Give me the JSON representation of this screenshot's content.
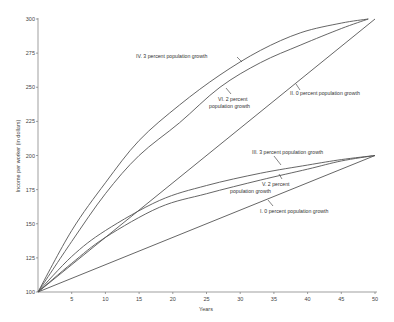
{
  "chart_data": {
    "type": "line",
    "title": "",
    "xlabel": "Years",
    "ylabel": "Income per worker (in dollars)",
    "xlim": [
      0,
      50
    ],
    "ylim": [
      100,
      300
    ],
    "xticks": [
      5,
      10,
      15,
      20,
      25,
      30,
      35,
      40,
      45,
      50
    ],
    "yticks": [
      100,
      125,
      150,
      175,
      200,
      225,
      250,
      275,
      300
    ],
    "grid": false,
    "legend": "inline annotations",
    "series": [
      {
        "name": "I. 0 percent population growth",
        "x": [
          0,
          50
        ],
        "y": [
          100,
          200
        ]
      },
      {
        "name": "II. 0 percent population growth",
        "x": [
          0,
          50
        ],
        "y": [
          100,
          300
        ]
      },
      {
        "name": "III. 3 percent population growth",
        "x": [
          0,
          5,
          10,
          18,
          25,
          33,
          40,
          45,
          50
        ],
        "y": [
          100,
          126,
          145,
          167,
          178,
          187,
          193,
          197,
          200
        ]
      },
      {
        "name": "IV. 3 percent population growth",
        "x": [
          0,
          5,
          10,
          15,
          21,
          27,
          33,
          39,
          45,
          49
        ],
        "y": [
          100,
          145,
          180,
          211,
          237,
          259,
          277,
          290,
          297,
          300
        ]
      },
      {
        "name": "V. 2 percent population growth",
        "x": [
          0,
          5,
          10,
          18,
          25,
          33,
          40,
          45,
          50
        ],
        "y": [
          100,
          121,
          140,
          162,
          172,
          182,
          190,
          196,
          200
        ]
      },
      {
        "name": "VI. 2 percent population growth",
        "x": [
          0,
          5,
          10,
          15,
          21,
          27,
          33,
          39,
          45,
          49
        ],
        "y": [
          100,
          137,
          172,
          200,
          224,
          250,
          268,
          281,
          293,
          300
        ]
      }
    ]
  },
  "labels": {
    "I": "I.  0 percent population growth",
    "II": "II.  0 percent population growth",
    "III": "III.  3 percent population growth",
    "IV": "IV.  3 percent population growth",
    "V_line1": "V.  2 percent",
    "V_line2": "population growth",
    "VI_line1": "VI.  2 percent",
    "VI_line2": "population growth"
  }
}
